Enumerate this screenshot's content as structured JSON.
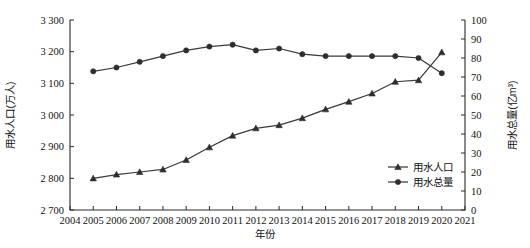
{
  "chart_data": {
    "type": "line",
    "title": "",
    "xlabel": "年份",
    "ylabel": "用水人口(万人)",
    "y2label": "用水总量(亿m³)",
    "grid": false,
    "legend_position": "bottom-right",
    "xlim": [
      2004,
      2021
    ],
    "ylim": [
      2700,
      3300
    ],
    "y2lim": [
      0,
      100
    ],
    "x_ticks": [
      "2004",
      "2005",
      "2006",
      "2007",
      "2008",
      "2009",
      "2010",
      "2011",
      "2012",
      "2013",
      "2014",
      "2015",
      "2016",
      "2017",
      "2018",
      "2019",
      "2020",
      "2021"
    ],
    "y_ticks": [
      "2 700",
      "2 800",
      "2 900",
      "3 000",
      "3 100",
      "3 200",
      "3 300"
    ],
    "y2_ticks": [
      "0",
      "10",
      "20",
      "30",
      "40",
      "50",
      "60",
      "70",
      "80",
      "90",
      "100"
    ],
    "x": [
      2005,
      2006,
      2007,
      2008,
      2009,
      2010,
      2011,
      2012,
      2013,
      2014,
      2015,
      2016,
      2017,
      2018,
      2019,
      2020
    ],
    "series": [
      {
        "name": "用水人口",
        "axis": "left",
        "marker": "triangle",
        "color": "#2e2e2e",
        "values": [
          2800,
          2812,
          2820,
          2828,
          2858,
          2898,
          2935,
          2958,
          2968,
          2990,
          3018,
          3042,
          3068,
          3105,
          3110,
          3198
        ]
      },
      {
        "name": "用水总量",
        "axis": "right",
        "marker": "circle",
        "color": "#2e2e2e",
        "values": [
          73,
          75,
          78,
          81,
          84,
          86,
          87,
          84,
          85,
          82,
          81,
          81,
          81,
          81,
          80,
          72
        ]
      }
    ]
  },
  "legend": {
    "items": [
      {
        "label": "用水人口"
      },
      {
        "label": "用水总量"
      }
    ]
  },
  "axes": {
    "left_title": "用水人口(万人)",
    "right_title": "用水总量(亿m³)",
    "x_title": "年份"
  }
}
